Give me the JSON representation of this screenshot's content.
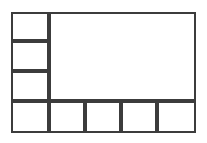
{
  "diagram": {
    "kind": "wireframe-box-layout",
    "background_color": "#ffffff",
    "stroke_color": "#3c3c3c",
    "fill_color": "#ffffff",
    "canvas": {
      "width": 207,
      "height": 143
    },
    "frame": {
      "x": 11,
      "y": 12,
      "width": 185,
      "height": 121
    },
    "regions": [
      {
        "name": "sidebar-cell-1",
        "label": "",
        "x": 11,
        "y": 12,
        "width": 38,
        "height": 29
      },
      {
        "name": "sidebar-cell-2",
        "label": "",
        "x": 11,
        "y": 41,
        "width": 38,
        "height": 30
      },
      {
        "name": "sidebar-cell-3",
        "label": "",
        "x": 11,
        "y": 71,
        "width": 38,
        "height": 30
      },
      {
        "name": "main-content-panel",
        "label": "",
        "x": 49,
        "y": 12,
        "width": 147,
        "height": 89
      },
      {
        "name": "footer-cell-1",
        "label": "",
        "x": 11,
        "y": 101,
        "width": 38,
        "height": 32
      },
      {
        "name": "footer-cell-2",
        "label": "",
        "x": 49,
        "y": 101,
        "width": 36,
        "height": 32
      },
      {
        "name": "footer-cell-3",
        "label": "",
        "x": 85,
        "y": 101,
        "width": 36,
        "height": 32
      },
      {
        "name": "footer-cell-4",
        "label": "",
        "x": 121,
        "y": 101,
        "width": 36,
        "height": 32
      },
      {
        "name": "footer-cell-5",
        "label": "",
        "x": 157,
        "y": 101,
        "width": 39,
        "height": 32
      }
    ]
  }
}
